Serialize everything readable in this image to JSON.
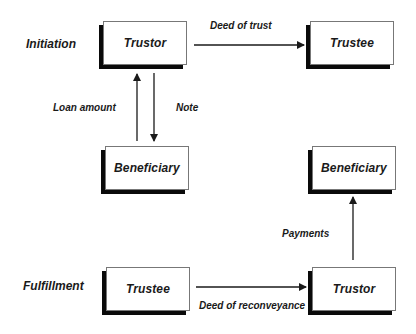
{
  "diagram": {
    "phases": [
      {
        "id": "initiation",
        "label": "Initiation"
      },
      {
        "id": "fulfillment",
        "label": "Fulfillment"
      }
    ],
    "nodes": [
      {
        "id": "init-trustor",
        "label": "Trustor",
        "phase": "initiation"
      },
      {
        "id": "init-trustee",
        "label": "Trustee",
        "phase": "initiation"
      },
      {
        "id": "init-beneficiary",
        "label": "Beneficiary",
        "phase": "initiation"
      },
      {
        "id": "mid-beneficiary",
        "label": "Beneficiary",
        "phase": "fulfillment"
      },
      {
        "id": "fulfill-trustee",
        "label": "Trustee",
        "phase": "fulfillment"
      },
      {
        "id": "fulfill-trustor",
        "label": "Trustor",
        "phase": "fulfillment"
      }
    ],
    "edges": [
      {
        "from": "init-trustor",
        "to": "init-trustee",
        "label": "Deed of trust"
      },
      {
        "from": "init-beneficiary",
        "to": "init-trustor",
        "label": "Loan amount"
      },
      {
        "from": "init-trustor",
        "to": "init-beneficiary",
        "label": "Note"
      },
      {
        "from": "fulfill-trustee",
        "to": "fulfill-trustor",
        "label": "Deed of reconveyance"
      },
      {
        "from": "fulfill-trustor",
        "to": "mid-beneficiary",
        "label": "Payments"
      }
    ],
    "colors": {
      "line": "#1a1a1a",
      "shadow": "#0a0a0a",
      "box_border": "#777777",
      "background": "#ffffff"
    }
  }
}
